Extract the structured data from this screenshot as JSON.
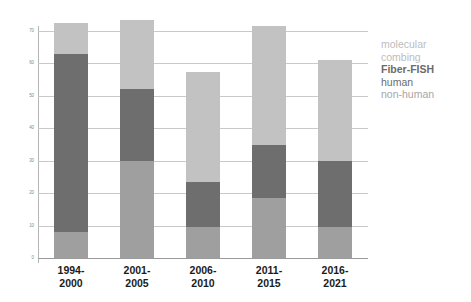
{
  "chart_data": {
    "type": "bar",
    "title": "",
    "subtype": "stacked",
    "xlabel": "",
    "ylabel": "",
    "ylim": [
      0,
      70
    ],
    "ytick_step": 10,
    "yticks": [
      0,
      10,
      20,
      30,
      40,
      50,
      60,
      70
    ],
    "ytick_labels": [
      "0",
      "10",
      "20",
      "30",
      "40",
      "50",
      "60",
      "70"
    ],
    "grid": true,
    "legend_position": "right",
    "categories": [
      "1994-2000",
      "2001-2005",
      "2006-2010",
      "2011-2015",
      "2016-2021"
    ],
    "category_lines": [
      [
        "1994-",
        "2000"
      ],
      [
        "2001-",
        "2005"
      ],
      [
        "2006-",
        "2010"
      ],
      [
        "2011-",
        "2015"
      ],
      [
        "2016-",
        "2021"
      ]
    ],
    "series": [
      {
        "name": "non-human",
        "color": "#9f9f9f",
        "stack_order": 0,
        "values": [
          8,
          30,
          9.5,
          18.5,
          9.5
        ]
      },
      {
        "name": "human",
        "color": "#6e6e6e",
        "stack_order": 1,
        "values": [
          55,
          22,
          14,
          16.5,
          20.5
        ]
      },
      {
        "name": "molecular combing",
        "color": "#c2c2c2",
        "stack_order": 2,
        "values": [
          9.5,
          21.5,
          34,
          36.5,
          31
        ]
      }
    ],
    "totals": [
      72.5,
      73.5,
      57.5,
      71.5,
      61
    ]
  },
  "legend": {
    "lines": [
      {
        "text": "molecular",
        "style": "combing-light"
      },
      {
        "text": "combing",
        "style": "combing-light"
      },
      {
        "text": "Fiber-FISH",
        "style": "fiberfish-bold"
      },
      {
        "text": "human",
        "style": "human-dark"
      },
      {
        "text": "non-human",
        "style": "nonhuman-mid"
      }
    ],
    "label_molecular": "molecular",
    "label_combing": "combing",
    "label_fiberfish": "Fiber-FISH",
    "label_human": "human",
    "label_nonhuman": "non-human"
  },
  "colors": {
    "molecular_combing": "#c2c2c2",
    "fiber_fish_human": "#6e6e6e",
    "fiber_fish_nonhuman": "#9f9f9f",
    "gridline": "#c9c9c9",
    "axis": "#b5b5b5",
    "tick_text": "#8a8a8a",
    "xlabel_text": "#1b1b1b",
    "background": "#ffffff"
  }
}
